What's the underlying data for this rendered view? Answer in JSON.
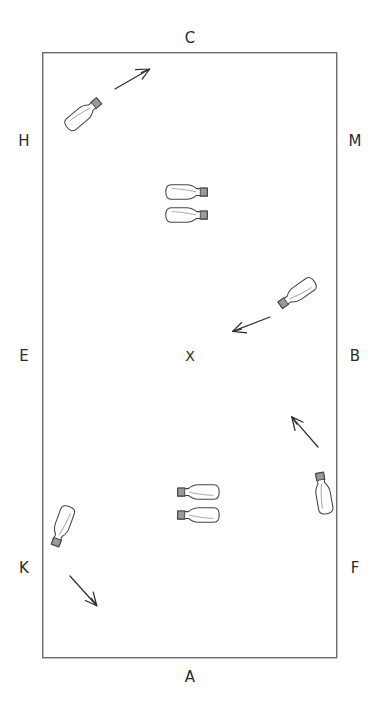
{
  "diagram": {
    "type": "spatial-arena-schematic",
    "background_color": "#ffffff",
    "stroke_color": "#4a4a4a",
    "label_color": "#2b2b2b",
    "canvas": {
      "width": 379,
      "height": 710
    },
    "arena": {
      "name": "rectangular-arena",
      "x": 42,
      "y": 52,
      "width": 295,
      "height": 606,
      "border_color": "#6b6b6b",
      "border_width": 1.4,
      "fill": "#ffffff"
    },
    "edge_labels": [
      {
        "id": "label-c",
        "text": "C",
        "side": "top",
        "x": 190,
        "y": 31
      },
      {
        "id": "label-h",
        "text": "H",
        "side": "left-upper",
        "x": 24,
        "y": 134
      },
      {
        "id": "label-m",
        "text": "M",
        "side": "right-upper",
        "x": 355,
        "y": 134
      },
      {
        "id": "label-e",
        "text": "E",
        "side": "left-middle",
        "x": 24,
        "y": 349
      },
      {
        "id": "label-b",
        "text": "B",
        "side": "right-middle",
        "x": 355,
        "y": 349
      },
      {
        "id": "label-k",
        "text": "K",
        "side": "left-lower",
        "x": 24,
        "y": 561
      },
      {
        "id": "label-f",
        "text": "F",
        "side": "right-lower",
        "x": 355,
        "y": 561
      },
      {
        "id": "label-a",
        "text": "A",
        "side": "bottom",
        "x": 190,
        "y": 670
      }
    ],
    "center_marker": {
      "id": "center-marker-x",
      "text": "X",
      "x": 190,
      "y": 349
    },
    "bottles": [
      {
        "id": "bottle-top-left",
        "cx": 88,
        "cy": 110,
        "rotation": -40,
        "neck": "up-right"
      },
      {
        "id": "bottle-center-upper-1",
        "cx": 193,
        "cy": 192,
        "rotation": 0,
        "neck": "right"
      },
      {
        "id": "bottle-center-upper-2",
        "cx": 193,
        "cy": 215,
        "rotation": 0,
        "neck": "right"
      },
      {
        "id": "bottle-right-middle",
        "cx": 292,
        "cy": 297,
        "rotation": 145,
        "neck": "down-left"
      },
      {
        "id": "bottle-right-lower",
        "cx": 322,
        "cy": 487,
        "rotation": 190,
        "neck": "up"
      },
      {
        "id": "bottle-center-lower-1",
        "cx": 192,
        "cy": 492,
        "rotation": 180,
        "neck": "left"
      },
      {
        "id": "bottle-center-lower-2",
        "cx": 192,
        "cy": 515,
        "rotation": 180,
        "neck": "left"
      },
      {
        "id": "bottle-bottom-left",
        "cx": 60,
        "cy": 532,
        "rotation": 110,
        "neck": "down-right"
      }
    ],
    "arrows": [
      {
        "id": "arrow-top-left",
        "x1": 117,
        "y1": 88,
        "x2": 158,
        "y2": 64,
        "direction": "up-right"
      },
      {
        "id": "arrow-right-middle",
        "x1": 268,
        "y1": 318,
        "x2": 228,
        "y2": 334,
        "direction": "down-left"
      },
      {
        "id": "arrow-right-lower",
        "x1": 315,
        "y1": 444,
        "x2": 292,
        "y2": 417,
        "direction": "up-left"
      },
      {
        "id": "arrow-bottom-left",
        "x1": 70,
        "y1": 577,
        "x2": 95,
        "y2": 604,
        "direction": "down-right"
      }
    ]
  }
}
